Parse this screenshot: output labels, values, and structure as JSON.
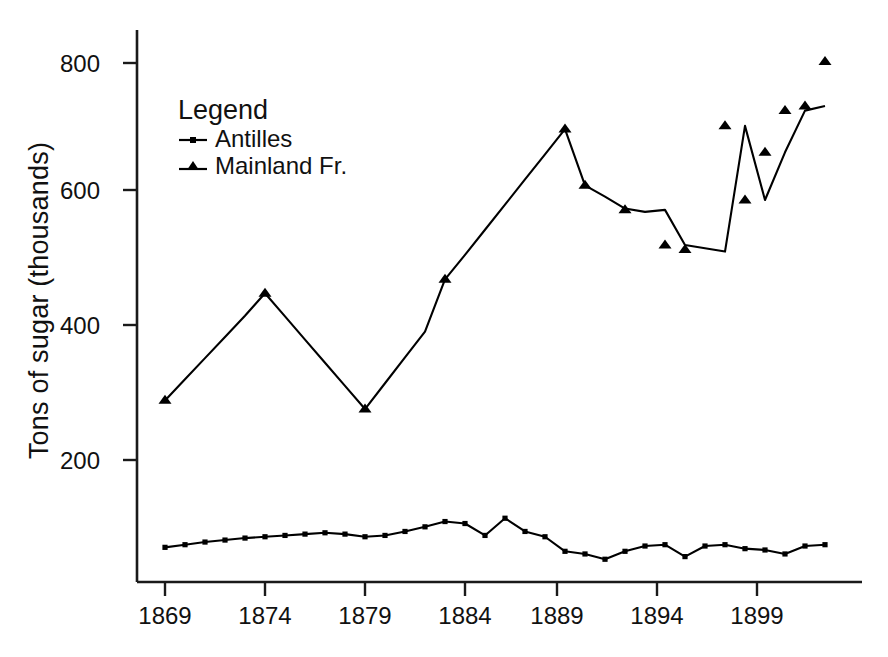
{
  "chart_data": {
    "type": "line",
    "title": "",
    "xlabel": "",
    "ylabel": "Tons of sugar (thousands)",
    "xlim": [
      1869,
      1902
    ],
    "ylim": [
      0,
      860
    ],
    "grid": false,
    "legend_position": "upper-left",
    "legend_title": "Legend",
    "x_ticks": [
      "1869",
      "1874",
      "1879",
      "1884",
      "1889",
      "1894",
      "1899"
    ],
    "x_tick_values": [
      1869,
      1874,
      1879,
      1884,
      1889,
      1894,
      1899
    ],
    "y_ticks": [
      "200",
      "400",
      "600",
      "800"
    ],
    "y_tick_values": [
      200,
      400,
      600,
      800
    ],
    "x": [
      1869,
      1870,
      1871,
      1872,
      1873,
      1874,
      1875,
      1876,
      1877,
      1878,
      1879,
      1880,
      1881,
      1882,
      1883,
      1884,
      1885,
      1886,
      1887,
      1888,
      1889,
      1890,
      1891,
      1892,
      1893,
      1894,
      1895,
      1896,
      1897,
      1898,
      1899,
      1900,
      1901,
      1902
    ],
    "series": [
      {
        "name": "Antilles",
        "marker": "square",
        "color": "#000000",
        "values": [
          68,
          72,
          76,
          79,
          82,
          84,
          86,
          88,
          90,
          88,
          84,
          86,
          92,
          99,
          107,
          104,
          86,
          112,
          92,
          84,
          62,
          58,
          50,
          62,
          70,
          72,
          54,
          70,
          72,
          66,
          64,
          58,
          70,
          72
        ]
      },
      {
        "name": "Mainland Fr.",
        "marker": "triangle",
        "color": "#000000",
        "values": [
          290,
          322,
          354,
          386,
          418,
          452,
          417,
          382,
          347,
          312,
          277,
          316,
          355,
          394,
          473,
          510,
          548,
          586,
          624,
          662,
          700,
          615,
          598,
          580,
          575,
          578,
          525,
          520,
          515,
          705,
          593,
          665,
          728,
          735
        ]
      }
    ],
    "marked_points": {
      "Mainland Fr.": [
        {
          "x": 1869,
          "y": 290
        },
        {
          "x": 1874,
          "y": 452
        },
        {
          "x": 1879,
          "y": 277
        },
        {
          "x": 1883,
          "y": 473
        },
        {
          "x": 1889,
          "y": 700
        },
        {
          "x": 1890,
          "y": 615
        },
        {
          "x": 1892,
          "y": 578
        },
        {
          "x": 1894,
          "y": 525
        },
        {
          "x": 1895,
          "y": 518
        },
        {
          "x": 1897,
          "y": 705
        },
        {
          "x": 1898,
          "y": 593
        },
        {
          "x": 1899,
          "y": 665
        },
        {
          "x": 1900,
          "y": 728
        },
        {
          "x": 1901,
          "y": 735
        },
        {
          "x": 1902,
          "y": 802
        }
      ]
    },
    "final_value_mainland": 802
  },
  "axes": {
    "y_axis_label": "Tons of sugar (thousands)"
  }
}
